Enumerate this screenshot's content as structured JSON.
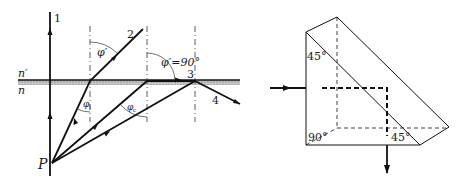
{
  "left_diagram": {
    "title": "Refraction at interface and total internal reflection",
    "medium_upper": "n′",
    "medium_lower": "n",
    "point_label": "P",
    "ray_labels": [
      "1",
      "2",
      "3",
      "4"
    ],
    "angle_refracted": "φ′",
    "angle_incident": "φ",
    "angle_incident_sub": "i",
    "angle_critical": "φ",
    "angle_critical_sub": "c",
    "angle_grazing": "φ′=90°",
    "colors": {
      "line": "#111111",
      "interface": "#9a9a9a"
    }
  },
  "right_diagram": {
    "title": "Total internal reflection in a 45-90-45 prism",
    "angle_top": "45°",
    "angle_bottom_left": "90°",
    "angle_bottom_right": "45°",
    "colors": {
      "line": "#111111"
    }
  }
}
